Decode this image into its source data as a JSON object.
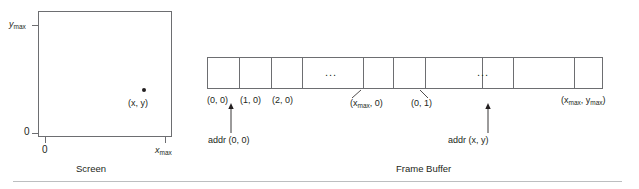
{
  "figure": {
    "screen": {
      "caption": "Screen",
      "y_axis_top_label": "y",
      "y_axis_top_sub": "max",
      "y_axis_zero_label": "0",
      "x_axis_zero_label": "0",
      "x_axis_max_label": "x",
      "x_axis_max_sub": "max",
      "point_label": "(x, y)"
    },
    "frame_buffer": {
      "caption": "Frame Buffer",
      "cell_labels": [
        "(0, 0)",
        "(1, 0)",
        "(2, 0)"
      ],
      "ellipsis": "...",
      "ellipsis_2": "...",
      "leader_labels": [
        {
          "text_pre": "(x",
          "sub": "max",
          "text_post": ", 0)"
        },
        {
          "text_pre": "(0, 1)",
          "sub": "",
          "text_post": ""
        }
      ],
      "xmax_ymax_label_pre": "(x",
      "xmax_ymax_sub1": "max",
      "xmax_ymax_mid": ", y",
      "xmax_ymax_sub2": "max",
      "xmax_ymax_post": ")",
      "addr_start_label": "addr (0, 0)",
      "addr_xy_label": "addr (x, y)"
    }
  },
  "colors": {
    "stroke": "#6d6e71",
    "text": "#231f20",
    "rule": "#bcbec0"
  }
}
